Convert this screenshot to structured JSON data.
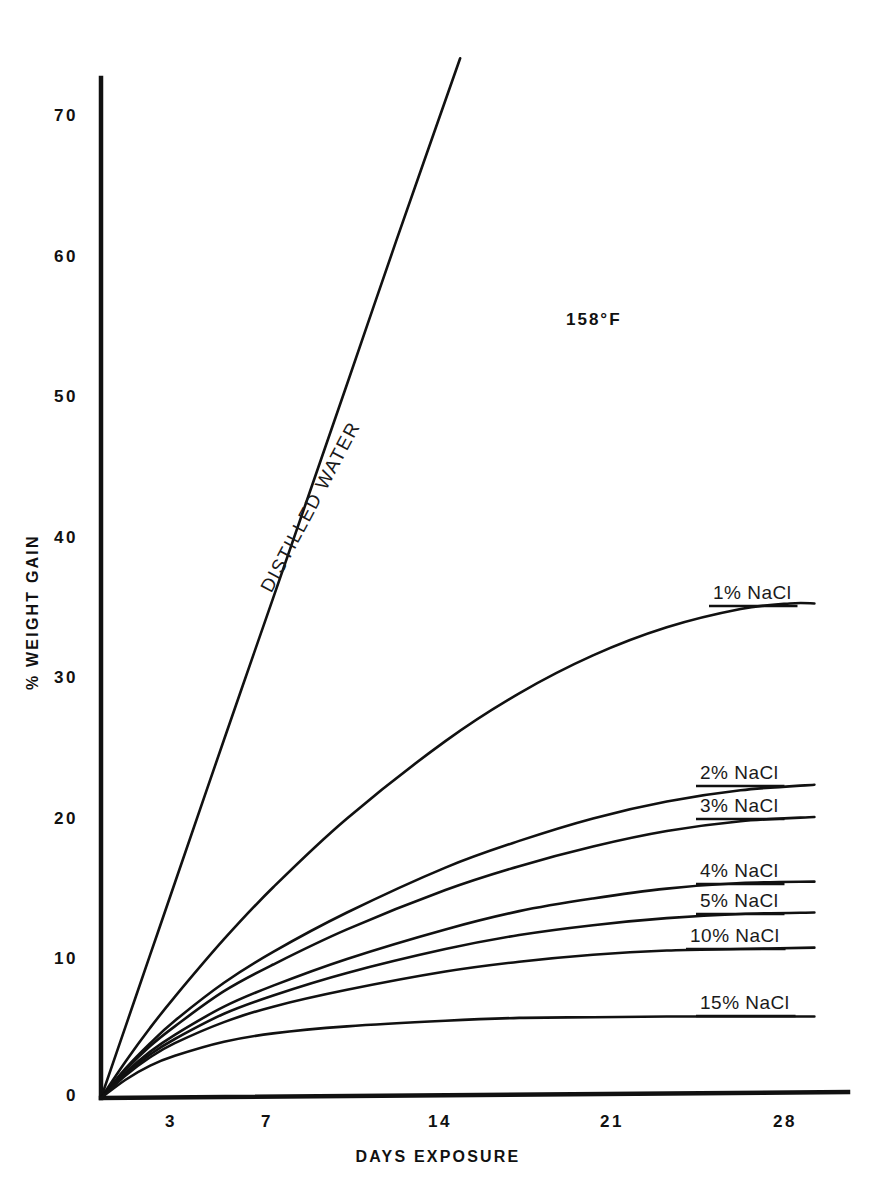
{
  "chart_data": {
    "type": "line",
    "title": "",
    "annotation": "158°F",
    "xlabel": "DAYS EXPOSURE",
    "ylabel": "% WEIGHT GAIN",
    "xticks": [
      3,
      7,
      14,
      21,
      28
    ],
    "xtick_labels": [
      "3",
      "7",
      "14",
      "21",
      "28"
    ],
    "yticks": [
      0,
      10,
      20,
      30,
      40,
      50,
      60,
      70
    ],
    "ytick_labels": [
      "0",
      "10",
      "20",
      "30",
      "40",
      "50",
      "60",
      "70"
    ],
    "xlim": [
      0,
      30.4
    ],
    "ylim": [
      0,
      74
    ],
    "grid": false,
    "legend_position": "inline-right-of-curves",
    "x_unit": "days",
    "y_unit": "percent",
    "series": [
      {
        "name": "DISTILLED WATER",
        "label": "DISTILLED WATER",
        "color": "#111111",
        "x": [
          0,
          1,
          2,
          3,
          5,
          7,
          10,
          12,
          14.6
        ],
        "values": [
          0,
          5.1,
          10.2,
          15.3,
          25.5,
          35.6,
          50.8,
          61.0,
          74.0
        ]
      },
      {
        "name": "1% NaCl",
        "label": "1% NaCl",
        "color": "#111111",
        "x": [
          0,
          1,
          2,
          3,
          5,
          7,
          10,
          14,
          17,
          20,
          23,
          26,
          28,
          29
        ],
        "values": [
          0,
          2.6,
          5.0,
          7.2,
          11.3,
          15.0,
          19.9,
          25.4,
          28.8,
          31.5,
          33.5,
          34.8,
          35.2,
          35.2
        ]
      },
      {
        "name": "2% NaCl",
        "label": "2% NaCl",
        "color": "#111111",
        "x": [
          0,
          1,
          2,
          3,
          5,
          7,
          10,
          14,
          17,
          20,
          23,
          26,
          29
        ],
        "values": [
          0,
          2.1,
          3.9,
          5.5,
          8.2,
          10.4,
          13.2,
          16.4,
          18.3,
          19.9,
          21.1,
          21.9,
          22.3
        ]
      },
      {
        "name": "3% NaCl",
        "label": "3% NaCl",
        "color": "#111111",
        "x": [
          0,
          1,
          2,
          3,
          5,
          7,
          10,
          14,
          17,
          20,
          23,
          26,
          29
        ],
        "values": [
          0,
          2.0,
          3.7,
          5.1,
          7.6,
          9.5,
          12.0,
          14.8,
          16.5,
          17.9,
          19.0,
          19.7,
          20.0
        ]
      },
      {
        "name": "4% NaCl",
        "label": "4% NaCl",
        "color": "#111111",
        "x": [
          0,
          1,
          2,
          3,
          5,
          7,
          10,
          14,
          17,
          20,
          23,
          26,
          29
        ],
        "values": [
          0,
          1.8,
          3.3,
          4.5,
          6.5,
          8.0,
          9.9,
          12.0,
          13.3,
          14.2,
          14.9,
          15.3,
          15.4
        ]
      },
      {
        "name": "5% NaCl",
        "label": "5% NaCl",
        "color": "#111111",
        "x": [
          0,
          1,
          2,
          3,
          5,
          7,
          10,
          14,
          17,
          20,
          23,
          26,
          29
        ],
        "values": [
          0,
          1.7,
          3.1,
          4.2,
          6.0,
          7.3,
          8.9,
          10.6,
          11.6,
          12.3,
          12.8,
          13.1,
          13.2
        ]
      },
      {
        "name": "10% NaCl",
        "label": "10% NaCl",
        "color": "#111111",
        "x": [
          0,
          1,
          2,
          3,
          5,
          7,
          10,
          14,
          17,
          20,
          23,
          26,
          29
        ],
        "values": [
          0,
          1.6,
          2.9,
          3.9,
          5.4,
          6.5,
          7.7,
          9.0,
          9.7,
          10.2,
          10.5,
          10.6,
          10.7
        ]
      },
      {
        "name": "15% NaCl",
        "label": "15% NaCl",
        "color": "#111111",
        "x": [
          0,
          1,
          2,
          3,
          5,
          7,
          10,
          14,
          17,
          20,
          23,
          26,
          29
        ],
        "values": [
          0,
          1.3,
          2.3,
          3.0,
          4.0,
          4.6,
          5.1,
          5.5,
          5.7,
          5.75,
          5.8,
          5.8,
          5.8
        ]
      }
    ],
    "series_label_positions": [
      {
        "name": "1% NaCl",
        "x_px": 713,
        "y_px": 582
      },
      {
        "name": "2% NaCl",
        "x_px": 700,
        "y_px": 762
      },
      {
        "name": "3% NaCl",
        "x_px": 700,
        "y_px": 795
      },
      {
        "name": "4% NaCl",
        "x_px": 700,
        "y_px": 860
      },
      {
        "name": "5% NaCl",
        "x_px": 700,
        "y_px": 890
      },
      {
        "name": "10% NaCl",
        "x_px": 690,
        "y_px": 925
      },
      {
        "name": "15% NaCl",
        "x_px": 700,
        "y_px": 992
      }
    ]
  },
  "axes": {
    "origin_px": {
      "x": 101,
      "y": 1098
    },
    "x_scale_px_per_day": 24.6,
    "y_scale_px_per_unit": 14.05,
    "y_axis_top_px": 78,
    "x_axis_right_px": 848
  }
}
